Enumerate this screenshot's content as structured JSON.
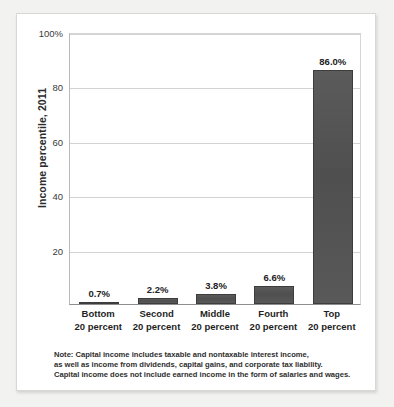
{
  "chart_data": {
    "type": "bar",
    "title": "",
    "subtitle": "",
    "xlabel": "",
    "ylabel": "Income percentile, 2011",
    "ylim": [
      0,
      100
    ],
    "grid": true,
    "legend": "none",
    "categories": [
      "Bottom 20 percent",
      "Second 20 percent",
      "Middle 20 percent",
      "Fourth 20 percent",
      "Top 20 percent"
    ],
    "category_lines": [
      {
        "line1": "Bottom",
        "line2": "20 percent"
      },
      {
        "line1": "Second",
        "line2": "20 percent"
      },
      {
        "line1": "Middle",
        "line2": "20 percent"
      },
      {
        "line1": "Fourth",
        "line2": "20 percent"
      },
      {
        "line1": "Top",
        "line2": "20 percent"
      }
    ],
    "values": [
      0.7,
      2.2,
      3.8,
      6.6,
      86.0
    ],
    "data_labels": [
      "0.7%",
      "2.2%",
      "3.8%",
      "6.6%",
      "86.0%"
    ],
    "ytick_labels": [
      "100%",
      "80",
      "60",
      "40",
      "20"
    ],
    "ytick_values": [
      100,
      80,
      60,
      40,
      20
    ],
    "bar_color": "#4f4f4f",
    "grid_color": "#d3d3d3",
    "axis_color": "#8e8e8e"
  },
  "note": {
    "line1": "Note: Capital income includes taxable and nontaxable interest income,",
    "line2": "as well as income from dividends, capital gains, and corporate tax liability.",
    "line3": "Capital income does not include earned income in the form of salaries and wages."
  }
}
